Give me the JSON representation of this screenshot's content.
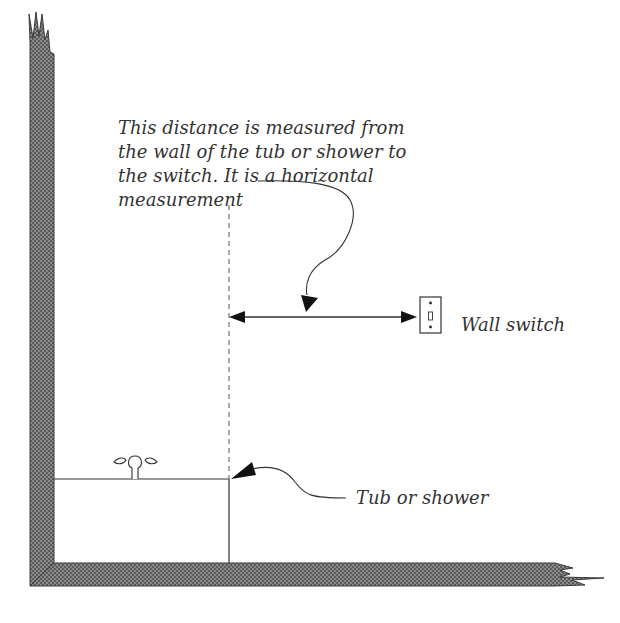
{
  "diagram": {
    "annotation": {
      "lines": [
        "This distance is measured from",
        "the wall of the tub or shower to",
        "the switch.  It is a horizontal",
        "measurement"
      ]
    },
    "labels": {
      "wall_switch": "Wall switch",
      "tub_or_shower": "Tub or shower"
    },
    "colors": {
      "wall_fill": "#555555",
      "line": "#333333",
      "text": "#333333",
      "background": "#ffffff"
    }
  }
}
